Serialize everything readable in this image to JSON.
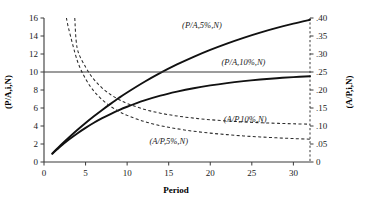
{
  "chart_data": {
    "type": "line",
    "title": "",
    "xlabel": "Period",
    "ylabel": "(P/A,i,N)",
    "ylabel_right": "(A/P,i,N)",
    "xlim": [
      0,
      32
    ],
    "ylim": [
      0,
      16
    ],
    "ylim_right": [
      0,
      0.4
    ],
    "grid": false,
    "legend_position": "inline-annotations",
    "xticks": [
      "0",
      "5",
      "10",
      "15",
      "20",
      "25",
      "30"
    ],
    "xtick_values": [
      0,
      5,
      10,
      15,
      20,
      25,
      30
    ],
    "yticks": [
      "0",
      "2",
      "4",
      "6",
      "8",
      "10",
      "12",
      "14",
      "16"
    ],
    "ytick_values": [
      0,
      2,
      4,
      6,
      8,
      10,
      12,
      14,
      16
    ],
    "yticks_right": [
      "0",
      ".05",
      ".10",
      ".15",
      ".20",
      ".25",
      ".30",
      ".35",
      ".40"
    ],
    "ytick_values_right": [
      0,
      0.05,
      0.1,
      0.15,
      0.2,
      0.25,
      0.3,
      0.35,
      0.4
    ],
    "series": [
      {
        "name": "(P/A,5%,N)",
        "style": "solid",
        "axis": "left",
        "x": [
          1,
          2,
          3,
          4,
          5,
          6,
          7,
          8,
          9,
          10,
          12,
          14,
          16,
          18,
          20,
          22,
          24,
          26,
          28,
          30,
          32
        ],
        "values": [
          0.95,
          1.86,
          2.72,
          3.55,
          4.33,
          5.08,
          5.79,
          6.46,
          7.11,
          7.72,
          8.86,
          9.9,
          10.84,
          11.69,
          12.46,
          13.16,
          13.8,
          14.38,
          14.9,
          15.37,
          15.8
        ]
      },
      {
        "name": "(P/A,10%,N)",
        "style": "solid",
        "axis": "left",
        "x": [
          1,
          2,
          3,
          4,
          5,
          6,
          7,
          8,
          9,
          10,
          12,
          14,
          16,
          18,
          20,
          22,
          24,
          26,
          28,
          30,
          32
        ],
        "values": [
          0.91,
          1.74,
          2.49,
          3.17,
          3.79,
          4.36,
          4.87,
          5.33,
          5.76,
          6.14,
          6.81,
          7.37,
          7.82,
          8.2,
          8.51,
          8.77,
          8.98,
          9.16,
          9.31,
          9.43,
          9.53
        ]
      },
      {
        "name": "asymptote-10pct",
        "style": "thin-solid",
        "axis": "left",
        "x": [
          0,
          32
        ],
        "values": [
          10.0,
          10.0
        ]
      },
      {
        "name": "(A/P,10%,N)",
        "style": "dashed",
        "axis": "right",
        "x": [
          3.7,
          4,
          5,
          6,
          7,
          8,
          9,
          10,
          12,
          14,
          16,
          18,
          20,
          22,
          24,
          26,
          28,
          30,
          32
        ],
        "values": [
          0.4,
          0.3155,
          0.2638,
          0.2296,
          0.2054,
          0.1874,
          0.1736,
          0.1627,
          0.1468,
          0.1357,
          0.1278,
          0.1219,
          0.1175,
          0.114,
          0.1113,
          0.1092,
          0.1075,
          0.1061,
          0.105
        ]
      },
      {
        "name": "(A/P,5%,N)",
        "style": "dashed",
        "axis": "right",
        "x": [
          2.7,
          3,
          4,
          5,
          6,
          7,
          8,
          9,
          10,
          12,
          14,
          16,
          18,
          20,
          22,
          24,
          26,
          28,
          30,
          32
        ],
        "values": [
          0.4,
          0.3672,
          0.282,
          0.231,
          0.197,
          0.1728,
          0.1547,
          0.1407,
          0.1295,
          0.1128,
          0.101,
          0.0923,
          0.0855,
          0.0802,
          0.076,
          0.0725,
          0.0696,
          0.0671,
          0.0651,
          0.0633
        ]
      }
    ],
    "annotations": [
      {
        "text": "(P/A,5%,N)",
        "x": 19.0,
        "y": 14.9,
        "anchor": "middle"
      },
      {
        "text": "(P/A,10%,N)",
        "x": 24.0,
        "y": 10.8,
        "anchor": "middle"
      },
      {
        "text": "(A/P,10%,N)",
        "x": 24.2,
        "y": 4.45,
        "anchor": "middle"
      },
      {
        "text": "(A/P,5%,N)",
        "x": 15.0,
        "y": 1.95,
        "anchor": "middle"
      }
    ]
  }
}
